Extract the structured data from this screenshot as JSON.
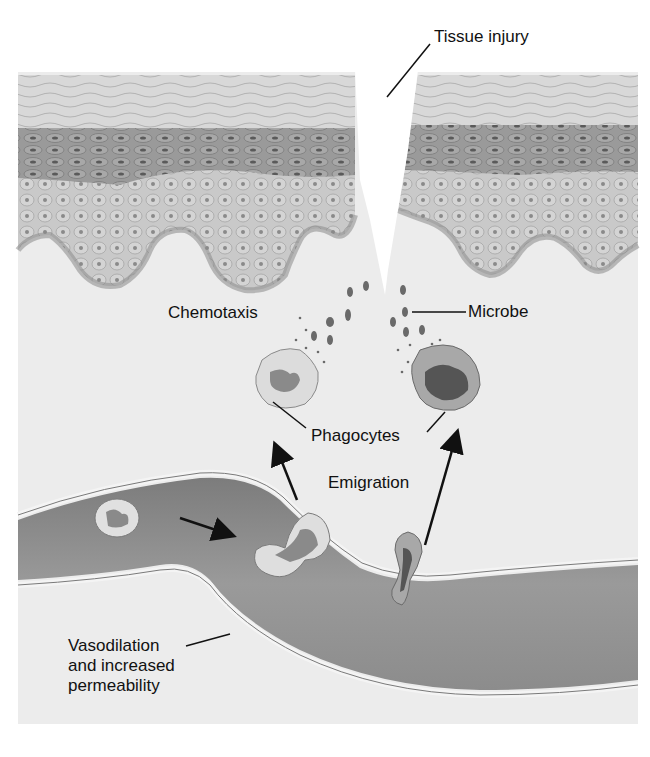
{
  "diagram": {
    "labels": {
      "tissue_injury": "Tissue injury",
      "chemotaxis": "Chemotaxis",
      "microbe": "Microbe",
      "phagocytes": "Phagocytes",
      "emigration": "Emigration",
      "vasodilation": [
        "Vasodilation",
        "and increased",
        "permeability"
      ]
    },
    "regions": [
      {
        "name": "epidermis-left",
        "type": "stratified epithelium"
      },
      {
        "name": "epidermis-right",
        "type": "stratified epithelium"
      },
      {
        "name": "wound-gap",
        "type": "tissue injury cleft"
      },
      {
        "name": "dermis",
        "type": "connective tissue"
      },
      {
        "name": "blood-vessel",
        "type": "capillary/venule"
      }
    ],
    "cells": [
      {
        "name": "phagocyte-left",
        "role": "Phagocyte"
      },
      {
        "name": "phagocyte-right",
        "role": "Phagocyte engulfing microbes"
      },
      {
        "name": "leukocyte-in-vessel",
        "role": "circulating white blood cell"
      },
      {
        "name": "leukocyte-squeezing",
        "role": "diapedesis through vessel wall"
      },
      {
        "name": "leukocyte-emigrating",
        "role": "emigrating through vessel wall"
      }
    ],
    "colors": {
      "background": "#ffffff",
      "tissue": "#ececec",
      "epidermis_top": "#d6d6d6",
      "epidermis_dark": "#9a9a9a",
      "epidermis_mid": "#c8c8c8",
      "vessel_lumen": "#8a8a8a",
      "vessel_wall": "#e8e8e8",
      "text": "#111111"
    }
  }
}
